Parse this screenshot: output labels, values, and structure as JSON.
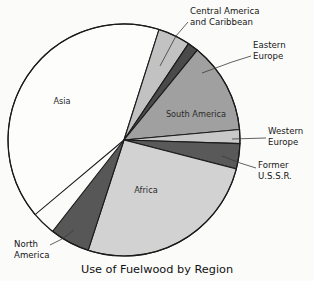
{
  "chart_data": {
    "type": "pie",
    "title": "Use of Fuelwood by Region",
    "xlabel": "",
    "ylabel": "",
    "legend_position": "none",
    "grid": false,
    "label_mode": "inside-and-callout",
    "categories": [
      "Asia",
      "Central America and Caribbean",
      "Eastern Europe",
      "South America",
      "Western Europe",
      "Former U.S.S.R.",
      "Africa",
      "North America"
    ],
    "values": [
      41.0,
      4.5,
      1.5,
      16.0,
      2.0,
      3.5,
      26.0,
      5.5
    ],
    "units": "percent of total fuelwood use",
    "slices": [
      {
        "name": "Asia",
        "value": 41.0,
        "color": "#fdfdfc",
        "label": "Asia",
        "label_placement": "inside",
        "label_x": 62,
        "label_y": 104,
        "start_angle": 140.0,
        "end_angle": 287.6
      },
      {
        "name": "Central America and Caribbean",
        "value": 4.5,
        "color": "#c2c2c2",
        "label": "Central America\nand Caribbean",
        "label_placement": "callout",
        "start_angle": 287.6,
        "end_angle": 303.8
      },
      {
        "name": "Eastern Europe",
        "value": 1.5,
        "color": "#4a4a4a",
        "label": "Eastern\nEurope",
        "label_placement": "callout",
        "start_angle": 303.8,
        "end_angle": 309.2
      },
      {
        "name": "South America",
        "value": 16.0,
        "color": "#a0a0a0",
        "label": "South America",
        "label_placement": "inside",
        "label_x": 196,
        "label_y": 117,
        "start_angle": 309.2,
        "end_angle": 354.8
      },
      {
        "name": "Western Europe",
        "value": 2.0,
        "color": "#c8c8c8",
        "label": "Western\nEurope",
        "label_placement": "callout",
        "start_angle": 354.8,
        "end_angle": 361.8
      },
      {
        "name": "Former U.S.S.R.",
        "value": 3.5,
        "color": "#595959",
        "label": "Former\nU.S.S.R.",
        "label_placement": "callout",
        "start_angle": 361.8,
        "end_angle": 374.4
      },
      {
        "name": "Africa",
        "value": 26.0,
        "color": "#d2d2d2",
        "label": "Africa",
        "label_placement": "inside",
        "label_x": 146,
        "label_y": 193,
        "start_angle": 374.4,
        "end_angle": 468.0
      },
      {
        "name": "North America",
        "value": 5.5,
        "color": "#575757",
        "label": "North\nAmerica",
        "label_placement": "callout",
        "start_angle": 468.0,
        "end_angle": 488.0
      }
    ],
    "callouts": [
      {
        "name": "central-america-and-caribbean",
        "lines": [
          "Central America",
          "and Caribbean"
        ],
        "text_x": 190,
        "text_y": 14,
        "anchor": "start",
        "leader": "M 188 22 L 176 36 L 160 66"
      },
      {
        "name": "eastern-europe",
        "lines": [
          "Eastern",
          "Europe"
        ],
        "text_x": 253,
        "text_y": 48,
        "anchor": "start",
        "leader": "M 251 56 L 232 62 L 202 73"
      },
      {
        "name": "western-europe",
        "lines": [
          "Western",
          "Europe"
        ],
        "text_x": 268,
        "text_y": 134,
        "anchor": "start",
        "leader": "M 266 138 L 232 139"
      },
      {
        "name": "former-ussr",
        "lines": [
          "Former",
          "U.S.S.R."
        ],
        "text_x": 258,
        "text_y": 168,
        "anchor": "start",
        "leader": "M 256 168 L 240 163 L 222 156"
      },
      {
        "name": "north-america",
        "lines": [
          "North",
          "America"
        ],
        "text_x": 14,
        "text_y": 247,
        "anchor": "start",
        "leader": "M 50 245 L 62 239 L 74 230"
      }
    ],
    "geometry": {
      "center_x": 124,
      "center_y": 140,
      "radius": 116,
      "outline_color": "#1a1a1a",
      "background": "#fbfbfa"
    },
    "title_x": 157,
    "title_y": 273
  }
}
